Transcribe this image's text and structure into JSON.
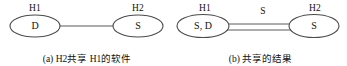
{
  "figure": {
    "panels": [
      {
        "id": "a",
        "caption": "(a) H2共享 H1的软件",
        "nodes": [
          {
            "host_label": "H1",
            "content": "D"
          },
          {
            "host_label": "H2",
            "content": "S"
          }
        ],
        "edge": {
          "style": "single-line",
          "label": "",
          "arrow": "none"
        }
      },
      {
        "id": "b",
        "caption": "(b) 共享的结果",
        "nodes": [
          {
            "host_label": "H1",
            "content": "S, D"
          },
          {
            "host_label": "H2",
            "content": "S"
          }
        ],
        "edge": {
          "style": "double-line",
          "label": "S",
          "arrow": "left"
        }
      }
    ],
    "colors": {
      "stroke": "#4a4a4a",
      "text": "#111111",
      "background": "#ffffff"
    }
  }
}
